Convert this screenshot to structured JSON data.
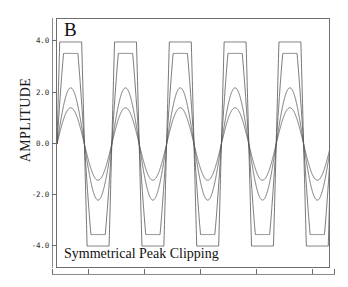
{
  "figure": {
    "panel_label": "B",
    "caption": "Symmetrical Peak Clipping",
    "ylabel": "AMPLITUDE"
  },
  "chart_data": {
    "type": "line",
    "title": "",
    "subtitle": "",
    "panel": "B",
    "annotation": "Symmetrical Peak Clipping",
    "xlabel": "",
    "ylabel": "AMPLITUDE",
    "xlim": [
      0,
      5
    ],
    "ylim": [
      -4.9,
      4.9
    ],
    "grid": false,
    "legend": "none",
    "x_tick_labels": [
      "",
      "",
      "",
      "",
      "",
      ""
    ],
    "y_ticks": [
      4.0,
      2.0,
      0.0,
      -2.0,
      -4.0
    ],
    "y_tick_labels": [
      "4.0",
      "2.0",
      "0.0",
      "-2.0",
      "-4.0"
    ],
    "cycles": 5,
    "clip_level": 4.0,
    "line_color": "#555555",
    "line_width": 0.8,
    "series": [
      {
        "name": "clip-hard",
        "raw_amplitude": 13.0,
        "clipped_at": 4.0,
        "description": "heavily clipped near-square wave, flat tops at +4.0 and flat troughs at -4.0"
      },
      {
        "name": "clip-moderate",
        "raw_amplitude": 5.2,
        "clipped_at": 3.55,
        "description": "moderately clipped sine, rounded flat peaks near +3.55 / -3.55"
      },
      {
        "name": "unclipped-mid",
        "raw_amplitude": 2.2,
        "clipped_at": 2.2,
        "description": "unclipped sine, peak 2.2"
      },
      {
        "name": "unclipped-small",
        "raw_amplitude": 1.42,
        "clipped_at": 1.42,
        "description": "unclipped sine, peak 1.42"
      }
    ]
  }
}
